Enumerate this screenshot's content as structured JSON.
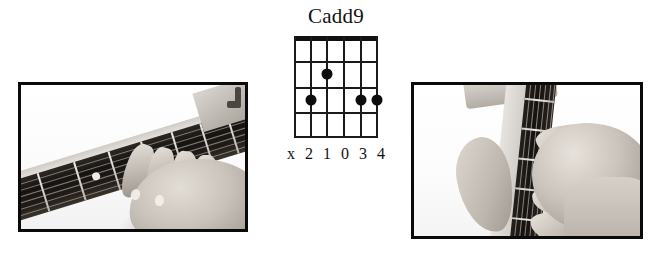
{
  "background_color": "#ffffff",
  "chord": {
    "name": "Cadd9",
    "instrument": "guitar",
    "string_count": 6,
    "fret_count": 4,
    "open_position": true,
    "nut_shown": true,
    "fingering_labels": "x 2 1 0 3 4",
    "labels_per_string": [
      "x",
      "2",
      "1",
      "0",
      "3",
      "4"
    ],
    "dot_color": "#0d0d0d",
    "line_color": "#1a1a1a",
    "dots": [
      {
        "string": 3,
        "fret": 2,
        "finger": "1"
      },
      {
        "string": 5,
        "fret": 3,
        "finger": "2"
      },
      {
        "string": 2,
        "fret": 3,
        "finger": "3"
      },
      {
        "string": 1,
        "fret": 3,
        "finger": "4"
      }
    ]
  },
  "photos": [
    {
      "id": "left",
      "caption": "",
      "description": "Grayscale photo of a left hand fretting a Cadd9 chord on a guitar neck, viewed at an angle from the player's side",
      "border_color": "#0a0a0a",
      "monochrome": true
    },
    {
      "id": "right",
      "caption": "",
      "description": "Grayscale photo of the same Cadd9 hand shape viewed from the front of the guitar neck, showing thumb placement behind the neck",
      "border_color": "#0a0a0a",
      "monochrome": true
    }
  ]
}
